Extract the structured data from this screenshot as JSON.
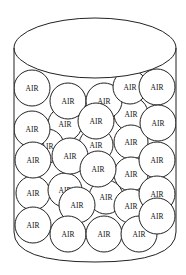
{
  "diagram": {
    "title": "",
    "label_text": "AIR",
    "colors": {
      "stroke": "#222222",
      "fill": "#ffffff",
      "text": "#111111"
    },
    "jar": {
      "top_ellipse": {
        "cx": 95,
        "cy": 48,
        "rx": 81,
        "ry": 30
      },
      "left_wall_x": 14,
      "right_wall_x": 176,
      "wall_bottom_y": 232,
      "bottom_center_y": 262
    },
    "balls_back": [
      {
        "cx": 65,
        "cy": 124,
        "r": 17,
        "label": "AIR"
      },
      {
        "cx": 131,
        "cy": 114,
        "r": 17,
        "label": "AIR"
      },
      {
        "cx": 47,
        "cy": 146,
        "r": 17,
        "label": "AIR"
      },
      {
        "cx": 131,
        "cy": 142,
        "r": 17,
        "label": "AIR"
      },
      {
        "cx": 96,
        "cy": 145,
        "r": 17,
        "label": "AIR"
      },
      {
        "cx": 33,
        "cy": 193,
        "r": 17,
        "label": "AIR"
      },
      {
        "cx": 65,
        "cy": 190,
        "r": 17,
        "label": "AIR"
      },
      {
        "cx": 106,
        "cy": 197,
        "r": 17,
        "label": "AIR"
      },
      {
        "cx": 131,
        "cy": 174,
        "r": 17,
        "label": "AIR"
      },
      {
        "cx": 131,
        "cy": 206,
        "r": 17,
        "label": "AIR"
      }
    ],
    "balls_front": [
      {
        "cx": 32,
        "cy": 88,
        "r": 18,
        "label": "AIR"
      },
      {
        "cx": 68,
        "cy": 101,
        "r": 18,
        "label": "AIR"
      },
      {
        "cx": 104,
        "cy": 101,
        "r": 18,
        "label": "AIR"
      },
      {
        "cx": 130,
        "cy": 87,
        "r": 17,
        "label": "AIR"
      },
      {
        "cx": 157,
        "cy": 87,
        "r": 18,
        "label": "AIR"
      },
      {
        "cx": 32,
        "cy": 129,
        "r": 18,
        "label": "AIR"
      },
      {
        "cx": 96,
        "cy": 121,
        "r": 18,
        "label": "AIR"
      },
      {
        "cx": 158,
        "cy": 123,
        "r": 18,
        "label": "AIR"
      },
      {
        "cx": 70,
        "cy": 156,
        "r": 18,
        "label": "AIR"
      },
      {
        "cx": 33,
        "cy": 160,
        "r": 18,
        "label": "AIR"
      },
      {
        "cx": 157,
        "cy": 160,
        "r": 18,
        "label": "AIR"
      },
      {
        "cx": 98,
        "cy": 169,
        "r": 18,
        "label": "AIR"
      },
      {
        "cx": 77,
        "cy": 205,
        "r": 18,
        "label": "AIR"
      },
      {
        "cx": 157,
        "cy": 194,
        "r": 18,
        "label": "AIR"
      },
      {
        "cx": 33,
        "cy": 225,
        "r": 18,
        "label": "AIR"
      },
      {
        "cx": 68,
        "cy": 234,
        "r": 18,
        "label": "AIR"
      },
      {
        "cx": 104,
        "cy": 234,
        "r": 18,
        "label": "AIR"
      },
      {
        "cx": 139,
        "cy": 234,
        "r": 18,
        "label": "AIR"
      },
      {
        "cx": 157,
        "cy": 216,
        "r": 18,
        "label": "AIR"
      }
    ]
  }
}
